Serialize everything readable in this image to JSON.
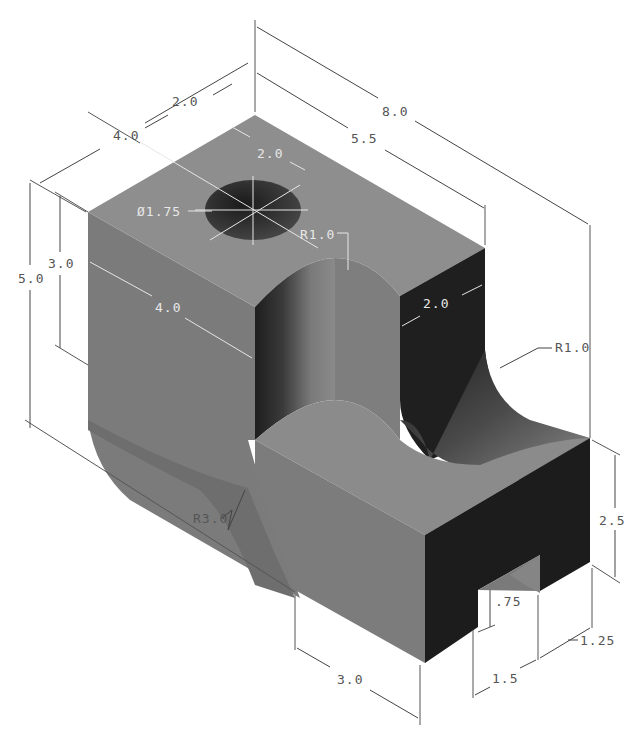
{
  "drawing": {
    "type": "isometric-technical-drawing",
    "colors": {
      "background": "#ffffff",
      "top_face": "#8c8c8c",
      "left_face": "#7a7a7a",
      "right_dark_face": "#1e1e1e",
      "dimension_line": "#444444",
      "dimension_text_dark": "#555555",
      "dimension_text_light": "#e8e8e8"
    },
    "dimensions": {
      "overall_length": "8.0",
      "upper_block_length": "5.5",
      "width_top": "4.0",
      "hole_offset_width": "2.0",
      "hole_offset_length": "2.0",
      "hole_diameter": "Ø1.75",
      "upper_fillet_radius": "R1.0",
      "slot_width": "2.0",
      "side_fillet_radius": "R1.0",
      "overall_height": "5.0",
      "upper_block_height": "3.0",
      "front_face_width": "4.0",
      "base_arc_radius": "R3.0",
      "base_width": "3.0",
      "step_height": "2.5",
      "notch_depth": ".75",
      "notch_width": "1.5",
      "notch_offset": "1.25"
    }
  }
}
